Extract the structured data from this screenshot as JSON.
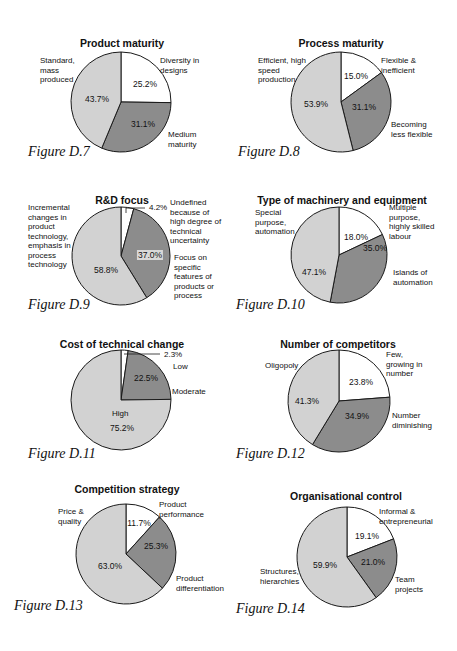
{
  "colors": {
    "white_slice": "#ffffff",
    "dark_slice": "#8c8c8c",
    "light_slice": "#d2d2d2",
    "outline": "#1a1a1a"
  },
  "chart_data": [
    {
      "type": "pie",
      "figure": "Figure D.7",
      "title": "Product maturity",
      "slices": [
        {
          "label": "Diversity in designs",
          "value": 25.2,
          "display": "25.2%"
        },
        {
          "label": "Medium maturity",
          "value": 31.1,
          "display": "31.1%"
        },
        {
          "label": "Standard, mass produced",
          "value": 43.7,
          "display": "43.7%"
        }
      ]
    },
    {
      "type": "pie",
      "figure": "Figure D.8",
      "title": "Process maturity",
      "slices": [
        {
          "label": "Flexible & inefficient",
          "value": 15.0,
          "display": "15.0%"
        },
        {
          "label": "Becoming less flexible",
          "value": 31.1,
          "display": "31.1%"
        },
        {
          "label": "Efficient, high speed production",
          "value": 53.9,
          "display": "53.9%"
        }
      ]
    },
    {
      "type": "pie",
      "figure": "Figure D.9",
      "title": "R&D focus",
      "slices": [
        {
          "label": "Undefined because of high degree of technical uncertainty",
          "value": 4.2,
          "display": "4.2%"
        },
        {
          "label": "Focus on specific features of products or process",
          "value": 37.0,
          "display": "37.0%"
        },
        {
          "label": "Incremental changes in product technology, emphasis in process technology",
          "value": 58.8,
          "display": "58.8%"
        }
      ]
    },
    {
      "type": "pie",
      "figure": "Figure D.10",
      "title": "Type of machinery and equipment",
      "slices": [
        {
          "label": "Multiple purpose, highly skilled labour",
          "value": 18.0,
          "display": "18.0%"
        },
        {
          "label": "Islands of automation",
          "value": 35.0,
          "display": "35.0%"
        },
        {
          "label": "Special purpose, automation",
          "value": 47.1,
          "display": "47.1%"
        }
      ]
    },
    {
      "type": "pie",
      "figure": "Figure D.11",
      "title": "Cost of technical change",
      "slices": [
        {
          "label": "Low",
          "value": 2.3,
          "display": "2.3%"
        },
        {
          "label": "Moderate",
          "value": 22.5,
          "display": "22.5%"
        },
        {
          "label": "High",
          "value": 75.2,
          "display": "75.2%"
        }
      ]
    },
    {
      "type": "pie",
      "figure": "Figure D.12",
      "title": "Number of competitors",
      "slices": [
        {
          "label": "Few, growing in number",
          "value": 23.8,
          "display": "23.8%"
        },
        {
          "label": "Number diminishing",
          "value": 34.9,
          "display": "34.9%"
        },
        {
          "label": "Oligopoly",
          "value": 41.3,
          "display": "41.3%"
        }
      ]
    },
    {
      "type": "pie",
      "figure": "Figure D.13",
      "title": "Competition strategy",
      "slices": [
        {
          "label": "Product performance",
          "value": 11.7,
          "display": "11.7%"
        },
        {
          "label": "Product differentiation",
          "value": 25.3,
          "display": "25.3%"
        },
        {
          "label": "Price & quality",
          "value": 63.0,
          "display": "63.0%"
        }
      ]
    },
    {
      "type": "pie",
      "figure": "Figure D.14",
      "title": "Organisational control",
      "slices": [
        {
          "label": "Informal & entrepreneurial",
          "value": 19.1,
          "display": "19.1%"
        },
        {
          "label": "Team projects",
          "value": 21.0,
          "display": "21.0%"
        },
        {
          "label": "Structures, hierarchies",
          "value": 59.9,
          "display": "59.9%"
        }
      ]
    }
  ],
  "labels": {
    "d7": {
      "l0": "Diversity in\ndesigns",
      "l1": "Medium\nmaturity",
      "l2": "Standard,\nmass\nproduced"
    },
    "d8": {
      "l0": "Flexible &\ninefficient",
      "l1": "Becoming\nless flexible",
      "l2": "Efficient, high\nspeed\nproduction"
    },
    "d9": {
      "l0": "Undefined\nbecause of\nhigh degree of\ntechnical\nuncertainty",
      "l1": "Focus on\nspecific\nfeatures of\nproducts or\nprocess",
      "l2": "Incremental\nchanges in\nproduct\ntechnology,\nemphasis in\nprocess\ntechnology"
    },
    "d10": {
      "l0": "Multiple\npurpose,\nhighly skilled\nlabour",
      "l1": "Islands of\nautomation",
      "l2": "Special\npurpose,\nautomation"
    },
    "d11": {
      "l0": "Low",
      "l1": "Moderate",
      "l2": "High"
    },
    "d12": {
      "l0": "Few,\ngrowing in\nnumber",
      "l1": "Number\ndiminishing",
      "l2": "Oligopoly"
    },
    "d13": {
      "l0": "Product\nperformance",
      "l1": "Product\ndifferentiation",
      "l2": "Price &\nquality"
    },
    "d14": {
      "l0": "Informal &\nentrepreneurial",
      "l1": "Team\nprojects",
      "l2": "Structures,\nhierarchies"
    }
  }
}
